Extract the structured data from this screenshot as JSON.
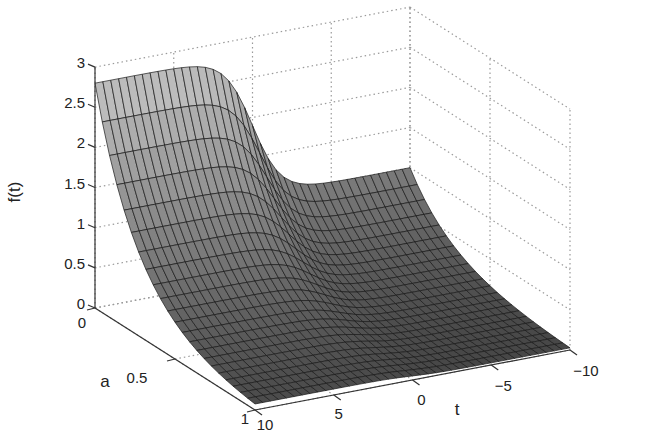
{
  "chart_data": {
    "type": "surface3d",
    "title": "",
    "xlabel": "t",
    "ylabel": "a",
    "zlabel": "f(t)",
    "x_ticks": [
      10,
      5,
      0,
      -5,
      -10
    ],
    "x_tick_labels": [
      "10",
      "5",
      "0",
      "−5",
      "−10"
    ],
    "y_ticks": [
      0,
      0.5,
      1
    ],
    "y_tick_labels": [
      "0",
      "0.5",
      "1"
    ],
    "z_ticks": [
      0,
      0.5,
      1,
      1.5,
      2,
      2.5,
      3
    ],
    "z_tick_labels": [
      "0",
      "0.5",
      "1",
      "1.5",
      "2",
      "2.5",
      "3"
    ],
    "xlim": [
      -10,
      10
    ],
    "ylim": [
      0,
      1
    ],
    "zlim": [
      0,
      3
    ],
    "grid": true,
    "colormap": "gray",
    "surface_description": "Sigmoid step in t: at a=0 f≈2.8 for t>2 dropping to ≈1 at t=-10; magnitude decays toward 0 as a increases to 1",
    "sample_rows": [
      {
        "a": 0.0,
        "t": [
          10,
          5,
          0,
          -5,
          -10
        ],
        "f": [
          2.8,
          2.8,
          1.9,
          1.1,
          1.0
        ]
      },
      {
        "a": 0.25,
        "t": [
          10,
          5,
          0,
          -5,
          -10
        ],
        "f": [
          1.2,
          1.2,
          0.8,
          0.45,
          0.4
        ]
      },
      {
        "a": 0.5,
        "t": [
          10,
          5,
          0,
          -5,
          -10
        ],
        "f": [
          0.5,
          0.5,
          0.33,
          0.2,
          0.18
        ]
      },
      {
        "a": 1.0,
        "t": [
          10,
          5,
          0,
          -5,
          -10
        ],
        "f": [
          0.05,
          0.05,
          0.03,
          0.02,
          0.02
        ]
      }
    ]
  },
  "colors": {
    "grid": "#9a9a9a",
    "axis": "#333333",
    "mesh_edge": "#1a1a1a",
    "surface_high": "#c4c4c4",
    "surface_low": "#444444"
  }
}
